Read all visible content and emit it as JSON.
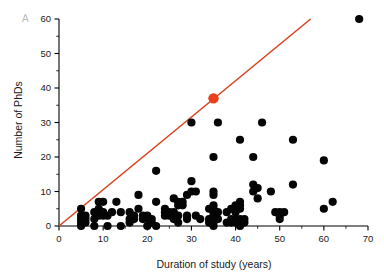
{
  "figure": {
    "panel_label": "A",
    "background_color": "#ffffff",
    "point_color": "#050505",
    "highlight_color": "#e8401c",
    "line_color": "#d9441f"
  },
  "chart_data": {
    "type": "scatter",
    "title": "",
    "xlabel": "Duration of study (years)",
    "ylabel": "Number of PhDs",
    "xlim": [
      0,
      70
    ],
    "ylim": [
      0,
      60
    ],
    "xticks": [
      0,
      10,
      20,
      30,
      40,
      50,
      60,
      70
    ],
    "yticks": [
      0,
      10,
      20,
      30,
      40,
      50,
      60
    ],
    "xtick_labels": [
      "0",
      "10",
      "20",
      "30",
      "40",
      "50",
      "60",
      "70"
    ],
    "ytick_labels": [
      "0",
      "10",
      "20",
      "30",
      "40",
      "50",
      "60"
    ],
    "x_minor_step": 5,
    "y_minor_step": 5,
    "grid": false,
    "legend": null,
    "reference_line": {
      "label": "one PhD per year",
      "x": [
        0,
        57
      ],
      "y": [
        0,
        60
      ],
      "slope": 1.05,
      "intercept": 0,
      "color": "#d9441f"
    },
    "highlight_point": {
      "label": "highlighted study",
      "x": 35,
      "y": 37,
      "color": "#e8401c"
    },
    "series": [
      {
        "name": "studies",
        "color": "#050505",
        "points": [
          [
            5,
            0
          ],
          [
            5,
            1
          ],
          [
            5,
            2
          ],
          [
            5,
            3
          ],
          [
            5,
            5
          ],
          [
            6,
            1
          ],
          [
            6,
            2
          ],
          [
            6,
            3
          ],
          [
            8,
            0
          ],
          [
            8,
            2
          ],
          [
            8,
            4
          ],
          [
            9,
            3
          ],
          [
            9,
            4
          ],
          [
            9,
            5
          ],
          [
            9,
            7
          ],
          [
            10,
            3
          ],
          [
            10,
            4
          ],
          [
            10,
            7
          ],
          [
            11,
            0
          ],
          [
            11,
            3
          ],
          [
            12,
            4
          ],
          [
            13,
            7
          ],
          [
            14,
            0
          ],
          [
            14,
            4
          ],
          [
            16,
            1
          ],
          [
            16,
            2
          ],
          [
            16,
            4
          ],
          [
            17,
            2
          ],
          [
            17,
            3
          ],
          [
            18,
            5
          ],
          [
            18,
            9
          ],
          [
            19,
            2
          ],
          [
            19,
            3
          ],
          [
            20,
            0
          ],
          [
            20,
            2
          ],
          [
            20,
            3
          ],
          [
            21,
            1
          ],
          [
            21,
            2
          ],
          [
            22,
            0
          ],
          [
            22,
            7
          ],
          [
            22,
            16
          ],
          [
            24,
            3
          ],
          [
            24,
            4
          ],
          [
            24,
            5
          ],
          [
            25,
            3
          ],
          [
            25,
            4
          ],
          [
            26,
            2
          ],
          [
            26,
            4
          ],
          [
            26,
            8
          ],
          [
            27,
            1
          ],
          [
            27,
            3
          ],
          [
            27,
            6
          ],
          [
            27,
            7
          ],
          [
            28,
            6
          ],
          [
            28,
            7
          ],
          [
            29,
            2
          ],
          [
            29,
            3
          ],
          [
            29,
            9
          ],
          [
            30,
            10
          ],
          [
            30,
            13
          ],
          [
            30,
            30
          ],
          [
            31,
            3
          ],
          [
            31,
            10
          ],
          [
            32,
            2
          ],
          [
            34,
            1
          ],
          [
            34,
            2
          ],
          [
            34,
            5
          ],
          [
            35,
            0
          ],
          [
            35,
            1
          ],
          [
            35,
            2
          ],
          [
            35,
            3
          ],
          [
            35,
            4
          ],
          [
            35,
            5
          ],
          [
            35,
            6
          ],
          [
            35,
            9
          ],
          [
            35,
            10
          ],
          [
            35,
            20
          ],
          [
            36,
            2
          ],
          [
            36,
            4
          ],
          [
            36,
            30
          ],
          [
            38,
            1
          ],
          [
            38,
            4
          ],
          [
            39,
            1
          ],
          [
            39,
            2
          ],
          [
            39,
            5
          ],
          [
            40,
            1
          ],
          [
            40,
            2
          ],
          [
            40,
            4
          ],
          [
            40,
            6
          ],
          [
            41,
            0
          ],
          [
            41,
            1
          ],
          [
            41,
            2
          ],
          [
            41,
            5
          ],
          [
            41,
            6
          ],
          [
            41,
            7
          ],
          [
            41,
            25
          ],
          [
            42,
            1
          ],
          [
            42,
            2
          ],
          [
            44,
            10
          ],
          [
            44,
            12
          ],
          [
            44,
            20
          ],
          [
            45,
            8
          ],
          [
            45,
            11
          ],
          [
            46,
            30
          ],
          [
            48,
            10
          ],
          [
            49,
            4
          ],
          [
            50,
            2
          ],
          [
            50,
            3
          ],
          [
            50,
            4
          ],
          [
            51,
            4
          ],
          [
            53,
            12
          ],
          [
            53,
            25
          ],
          [
            60,
            5
          ],
          [
            60,
            19
          ],
          [
            62,
            7
          ],
          [
            68,
            60
          ]
        ]
      }
    ]
  }
}
